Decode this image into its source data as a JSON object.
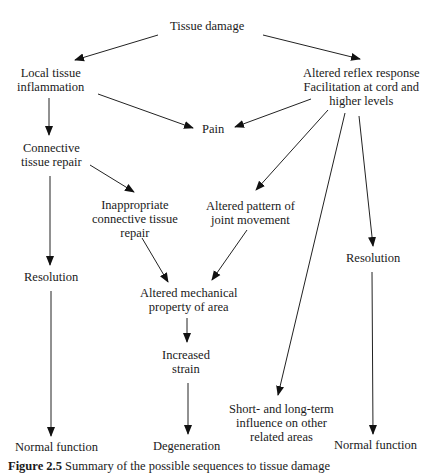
{
  "diagram": {
    "title": "Possible sequences to tissue damage",
    "nodes": {
      "tissue_damage": "Tissue damage",
      "local_inflammation_1": "Local tissue",
      "local_inflammation_2": "inflammation",
      "altered_reflex_1": "Altered reflex response",
      "altered_reflex_2": "Facilitation at cord and",
      "altered_reflex_3": "higher levels",
      "pain": "Pain",
      "ct_repair_1": "Connective",
      "ct_repair_2": "tissue repair",
      "inappropriate_1": "Inappropriate",
      "inappropriate_2": "connective tissue",
      "inappropriate_3": "repair",
      "altered_pattern_1": "Altered pattern of",
      "altered_pattern_2": "joint movement",
      "resolution_left": "Resolution",
      "resolution_right": "Resolution",
      "altered_mech_1": "Altered mechanical",
      "altered_mech_2": "property of area",
      "increased_strain_1": "Increased",
      "increased_strain_2": "strain",
      "short_long_1": "Short- and long-term",
      "short_long_2": "influence on other",
      "short_long_3": "related areas",
      "normal_left": "Normal function",
      "degeneration": "Degeneration",
      "normal_right": "Normal function"
    },
    "edges": [
      [
        "Tissue damage",
        "Local tissue inflammation"
      ],
      [
        "Tissue damage",
        "Altered reflex response"
      ],
      [
        "Local tissue inflammation",
        "Pain"
      ],
      [
        "Altered reflex response",
        "Pain"
      ],
      [
        "Local tissue inflammation",
        "Connective tissue repair"
      ],
      [
        "Connective tissue repair",
        "Inappropriate connective tissue repair"
      ],
      [
        "Connective tissue repair",
        "Resolution"
      ],
      [
        "Altered reflex response",
        "Altered pattern of joint movement"
      ],
      [
        "Altered reflex response",
        "Short- and long-term influence on other related areas"
      ],
      [
        "Altered reflex response",
        "Resolution"
      ],
      [
        "Inappropriate connective tissue repair",
        "Altered mechanical property of area"
      ],
      [
        "Altered pattern of joint movement",
        "Altered mechanical property of area"
      ],
      [
        "Altered mechanical property of area",
        "Increased strain"
      ],
      [
        "Increased strain",
        "Degeneration"
      ],
      [
        "Resolution",
        "Normal function"
      ],
      [
        "Resolution",
        "Normal function"
      ]
    ],
    "caption": {
      "label": "Figure 2.5",
      "text": "Summary of the possible sequences to tissue damage"
    }
  }
}
